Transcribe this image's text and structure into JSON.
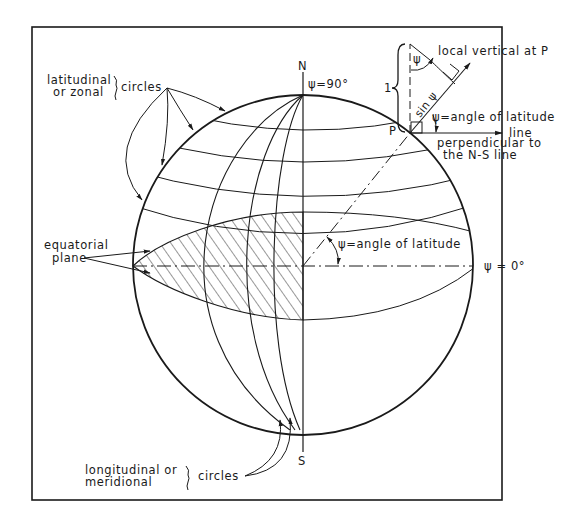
{
  "diagram": {
    "colors": {
      "ink": "#1a1a1a",
      "background": "#ffffff"
    },
    "poles": {
      "north": "N",
      "south": "S"
    },
    "north_pole_label": "ψ=90°",
    "equator_label": "ψ = 0°",
    "point_label": "P",
    "labels": {
      "latitudinal_line1": "latitudinal",
      "latitudinal_line2": "or zonal",
      "latitudinal_circles": "circles",
      "equatorial_line1": "equatorial",
      "equatorial_line2": "plane",
      "longitudinal_line1": "longitudinal or",
      "longitudinal_line2": "meridional",
      "longitudinal_circles": "circles",
      "center_angle": "ψ=angle of latitude",
      "inset_angle": "ψ=angle of latitude",
      "local_vertical": "local vertical at P",
      "perp_line1": "line",
      "perp_line2": "perpendicular to",
      "perp_line3": "the N-S line",
      "unit_length": "1",
      "sin_psi": "sin ψ",
      "psi_symbol": "ψ"
    }
  }
}
